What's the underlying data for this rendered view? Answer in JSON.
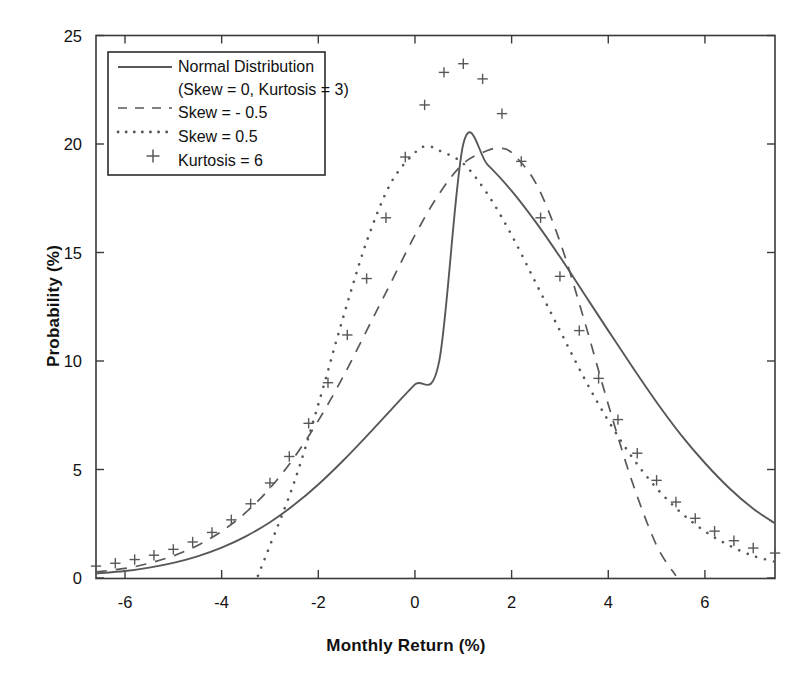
{
  "chart_data": {
    "type": "line",
    "title": "",
    "xlabel": "Monthly Return (%)",
    "ylabel": "Probability (%)",
    "xlim": [
      -6.6,
      7.45
    ],
    "ylim": [
      0,
      25
    ],
    "xticks": [
      -6,
      -4,
      -2,
      0,
      2,
      4,
      6
    ],
    "xticklabels": [
      "-6",
      "-4",
      "-2",
      "0",
      "2",
      "4",
      "6"
    ],
    "yticks": [
      0,
      5,
      10,
      15,
      20,
      25
    ],
    "yticklabels": [
      "0",
      "5",
      "10",
      "15",
      "20",
      "25"
    ],
    "grid": false,
    "legend_position": "upper left",
    "series": [
      {
        "name": "Normal Distribution\n(Skew = 0, Kurtosis = 3)",
        "style": "solid",
        "marker": "none",
        "color": "#585858",
        "params": {
          "mean": 1.0,
          "std": 1.995,
          "peak": 20.0,
          "skew": 0,
          "kurtosis": 3
        },
        "x": [
          -6.6,
          -6.0,
          -5.5,
          -5.0,
          -4.5,
          -4.0,
          -3.5,
          -3.0,
          -2.5,
          -2.0,
          -1.5,
          -1.0,
          -0.5,
          0.0,
          0.5,
          1.0,
          1.5,
          2.0,
          2.5,
          3.0,
          3.5,
          4.0,
          4.5,
          5.0,
          5.5,
          6.0,
          6.5,
          7.0,
          7.45
        ],
        "y": [
          0.21,
          0.32,
          0.48,
          0.7,
          1.0,
          1.4,
          1.92,
          2.57,
          3.37,
          4.31,
          5.38,
          6.54,
          7.74,
          8.92,
          9.97,
          20.0,
          19.05,
          17.84,
          16.4,
          14.8,
          13.1,
          11.4,
          9.72,
          8.1,
          6.61,
          5.3,
          4.15,
          3.19,
          2.52
        ]
      },
      {
        "name": "Skew = - 0.5",
        "style": "dashed",
        "marker": "none",
        "color": "#585858",
        "params": {
          "skew": -0.5,
          "peak": 19.8,
          "peak_x": 1.75,
          "right_cut": 5.4
        },
        "x": [
          -6.6,
          -6.0,
          -5.5,
          -5.0,
          -4.5,
          -4.0,
          -3.5,
          -3.0,
          -2.5,
          -2.0,
          -1.5,
          -1.0,
          -0.5,
          0.0,
          0.5,
          1.0,
          1.5,
          1.75,
          2.0,
          2.5,
          3.0,
          3.5,
          4.0,
          4.5,
          5.0,
          5.4
        ],
        "y": [
          0.28,
          0.44,
          0.68,
          1.02,
          1.5,
          2.15,
          3.02,
          4.14,
          5.55,
          7.25,
          9.22,
          11.4,
          13.6,
          15.8,
          17.7,
          19.1,
          19.7,
          19.8,
          19.6,
          18.2,
          15.5,
          11.9,
          8.0,
          4.4,
          1.5,
          0.1
        ]
      },
      {
        "name": "Skew = 0.5",
        "style": "dotted",
        "marker": "none",
        "color": "#585858",
        "params": {
          "skew": 0.5,
          "peak": 19.9,
          "peak_x": 0.25,
          "left_cut": -3.25
        },
        "x": [
          -3.25,
          -3.0,
          -2.5,
          -2.0,
          -1.5,
          -1.0,
          -0.5,
          0.0,
          0.25,
          0.5,
          1.0,
          1.5,
          2.0,
          2.5,
          3.0,
          3.5,
          4.0,
          4.5,
          5.0,
          5.5,
          6.0,
          6.5,
          7.0,
          7.45
        ],
        "y": [
          0.1,
          1.5,
          4.4,
          8.0,
          11.9,
          15.5,
          18.2,
          19.6,
          19.9,
          19.7,
          19.1,
          17.7,
          15.8,
          13.6,
          11.4,
          9.22,
          7.25,
          5.55,
          4.14,
          3.02,
          2.15,
          1.5,
          1.02,
          0.75
        ]
      },
      {
        "name": "Kurtosis = 6",
        "style": "markers",
        "marker": "plus",
        "color": "#585858",
        "params": {
          "kurtosis": 6,
          "peak": 23.7,
          "peak_x": 1.0
        },
        "x": [
          -6.6,
          -6.2,
          -5.8,
          -5.4,
          -5.0,
          -4.6,
          -4.2,
          -3.8,
          -3.4,
          -3.0,
          -2.6,
          -2.2,
          -1.8,
          -1.4,
          -1.0,
          -0.6,
          -0.2,
          0.2,
          0.6,
          1.0,
          1.4,
          1.8,
          2.2,
          2.6,
          3.0,
          3.4,
          3.8,
          4.2,
          4.6,
          5.0,
          5.4,
          5.8,
          6.2,
          6.6,
          7.0,
          7.45
        ],
        "y": [
          0.55,
          0.68,
          0.85,
          1.05,
          1.32,
          1.66,
          2.1,
          2.68,
          3.42,
          4.38,
          5.6,
          7.13,
          9.0,
          11.2,
          13.8,
          16.6,
          19.4,
          21.8,
          23.3,
          23.7,
          23.0,
          21.4,
          19.2,
          16.6,
          13.9,
          11.4,
          9.2,
          7.3,
          5.75,
          4.5,
          3.5,
          2.75,
          2.16,
          1.72,
          1.38,
          1.15
        ]
      }
    ],
    "legend_entries": [
      {
        "label_line1": "Normal Distribution",
        "label_line2": "(Skew = 0, Kurtosis = 3)",
        "sample": "solid-line"
      },
      {
        "label_line1": "Skew = - 0.5",
        "label_line2": "",
        "sample": "dashed-line"
      },
      {
        "label_line1": "Skew = 0.5",
        "label_line2": "",
        "sample": "dotted-line"
      },
      {
        "label_line1": "Kurtosis = 6",
        "label_line2": "",
        "sample": "plus-marker"
      }
    ]
  }
}
